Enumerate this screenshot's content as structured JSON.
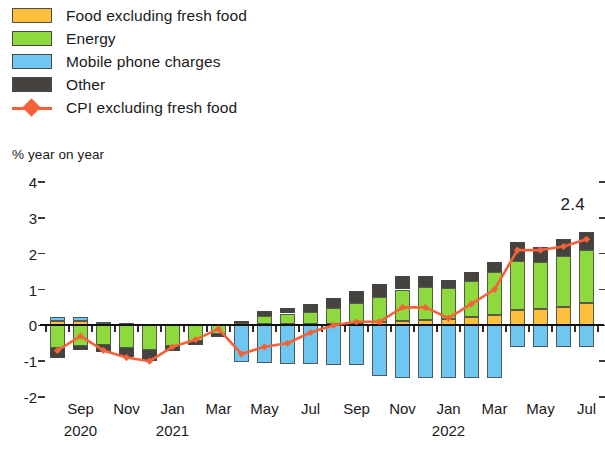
{
  "legend": {
    "items": [
      {
        "label": "Food excluding fresh food",
        "color": "#fcc03c",
        "kind": "swatch",
        "icon": "legend-swatch-food"
      },
      {
        "label": "Energy",
        "color": "#8ed93e",
        "kind": "swatch",
        "icon": "legend-swatch-energy"
      },
      {
        "label": "Mobile phone charges",
        "color": "#6ec7f0",
        "kind": "swatch",
        "icon": "legend-swatch-mobile"
      },
      {
        "label": "Other",
        "color": "#46423d",
        "kind": "swatch",
        "icon": "legend-swatch-other"
      },
      {
        "label": "CPI excluding fresh food",
        "color": "#f4623a",
        "kind": "line",
        "icon": "legend-line-marker"
      }
    ]
  },
  "axis": {
    "y_title": "% year on year",
    "y_ticks": [
      4,
      3,
      2,
      1,
      0,
      -1,
      -2
    ],
    "y_tick_labels": [
      "4",
      "3",
      "2",
      "1",
      "0",
      "-1",
      "-2"
    ],
    "x_tick_labels": [
      "Sep",
      "Nov",
      "Jan",
      "Mar",
      "May",
      "Jul",
      "Sep",
      "Nov",
      "Jan",
      "Mar",
      "May",
      "Jul"
    ],
    "year_labels": [
      {
        "text": "2020",
        "at_category": "Sep-2020"
      },
      {
        "text": "2021",
        "at_category": "Jan-2021"
      },
      {
        "text": "2022",
        "at_category": "Jan-2022"
      }
    ]
  },
  "annotation": {
    "text": "2.4",
    "value": 2.4,
    "at_category": "Jul-2022"
  },
  "chart_data": {
    "type": "bar",
    "subtype": "stacked-bar-with-line",
    "title": "",
    "subtitle": "",
    "xlabel": "",
    "ylabel": "% year on year",
    "ylim": [
      -2,
      4
    ],
    "grid": false,
    "legend_position": "top-left",
    "categories": [
      "Aug-2020",
      "Sep-2020",
      "Oct-2020",
      "Nov-2020",
      "Dec-2020",
      "Jan-2021",
      "Feb-2021",
      "Mar-2021",
      "Apr-2021",
      "May-2021",
      "Jun-2021",
      "Jul-2021",
      "Aug-2021",
      "Sep-2021",
      "Oct-2021",
      "Nov-2021",
      "Dec-2021",
      "Jan-2022",
      "Feb-2022",
      "Mar-2022",
      "Apr-2022",
      "May-2022",
      "Jun-2022",
      "Jul-2022"
    ],
    "series": [
      {
        "name": "Food excluding fresh food",
        "color": "#fcc03c",
        "values": [
          0.13,
          0.12,
          0.05,
          0.04,
          0.02,
          0.02,
          0.02,
          0.03,
          0.02,
          0.03,
          0.03,
          0.04,
          0.05,
          0.06,
          0.08,
          0.12,
          0.14,
          0.18,
          0.22,
          0.3,
          0.42,
          0.46,
          0.52,
          0.62
        ]
      },
      {
        "name": "Energy",
        "color": "#8ed93e",
        "values": [
          -0.62,
          -0.58,
          -0.55,
          -0.62,
          -0.7,
          -0.58,
          -0.45,
          -0.25,
          0.05,
          0.22,
          0.3,
          0.33,
          0.42,
          0.56,
          0.72,
          0.88,
          0.94,
          0.86,
          1.02,
          1.18,
          1.38,
          1.3,
          1.42,
          1.48
        ]
      },
      {
        "name": "Mobile phone charges",
        "color": "#6ec7f0",
        "values": [
          0.1,
          0.1,
          0.03,
          0.02,
          0.02,
          0.03,
          0.03,
          0.02,
          -1.02,
          -1.06,
          -1.08,
          -1.08,
          -1.12,
          -1.12,
          -1.42,
          -1.48,
          -1.46,
          -1.48,
          -1.48,
          -1.46,
          -0.6,
          -0.6,
          -0.6,
          -0.6
        ]
      },
      {
        "name": "Other",
        "color": "#46423d",
        "values": [
          -0.3,
          -0.12,
          -0.2,
          -0.26,
          -0.3,
          -0.14,
          -0.1,
          -0.08,
          0.04,
          0.14,
          0.16,
          0.22,
          0.3,
          0.34,
          0.36,
          0.38,
          0.3,
          0.22,
          0.26,
          0.3,
          0.52,
          0.44,
          0.48,
          0.5
        ]
      }
    ],
    "line_series": {
      "name": "CPI excluding fresh food",
      "color": "#f4623a",
      "values": [
        -0.7,
        -0.3,
        -0.7,
        -0.9,
        -1.0,
        -0.6,
        -0.4,
        -0.1,
        -0.8,
        -0.6,
        -0.5,
        -0.2,
        0.0,
        0.1,
        0.1,
        0.5,
        0.5,
        0.2,
        0.6,
        1.0,
        2.1,
        2.1,
        2.2,
        2.4
      ]
    }
  }
}
